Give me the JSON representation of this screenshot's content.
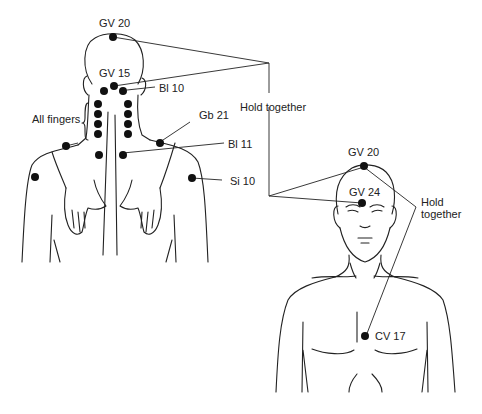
{
  "diagram": {
    "back_figure": {
      "labels": {
        "gv20": "GV 20",
        "gv15": "GV 15",
        "bl10": "Bl 10",
        "all_fingers": "All fingers",
        "gb21": "Gb 21",
        "bl11": "Bl 11",
        "si10": "Si 10"
      }
    },
    "front_figure": {
      "labels": {
        "gv20": "GV 20",
        "gv24": "GV 24",
        "cv17": "CV 17"
      }
    },
    "connectors": {
      "hold_together_1": "Hold together",
      "hold_together_2_line1": "Hold",
      "hold_together_2_line2": "together"
    },
    "colors": {
      "stroke": "#222222",
      "point": "#111111",
      "background": "#ffffff"
    }
  }
}
